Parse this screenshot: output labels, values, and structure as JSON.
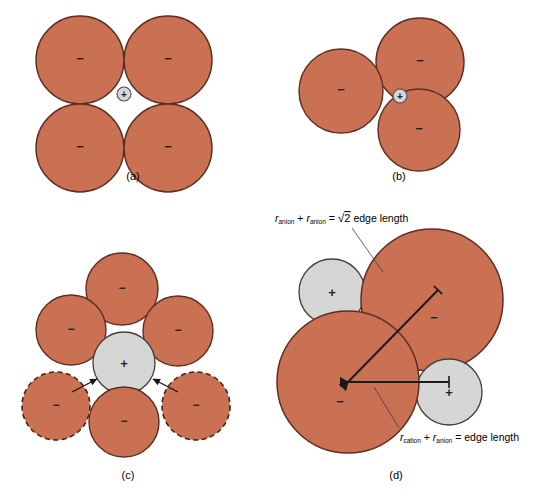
{
  "figure": {
    "background_color": "#ffffff",
    "colors": {
      "anion_fill": "#ca7053",
      "anion_stroke": "#5d2f22",
      "cation_fill": "#d6d6d4",
      "cation_stroke": "#4c4c4c",
      "line_color": "#1a1a1a",
      "text_color": "#000000"
    },
    "panels": [
      {
        "id": "a",
        "caption": "(a)",
        "caption_x": 133,
        "caption_y": 180,
        "description": "Four equal anions in square arrangement with a very small cation in the central hole",
        "circles": [
          {
            "name": "anion-top-left",
            "cx": 80,
            "cy": 60,
            "r": 44,
            "type": "anion",
            "sign": "−",
            "outline": "solid"
          },
          {
            "name": "anion-top-right",
            "cx": 168,
            "cy": 60,
            "r": 44,
            "type": "anion",
            "sign": "−",
            "outline": "solid"
          },
          {
            "name": "anion-bottom-left",
            "cx": 80,
            "cy": 148,
            "r": 44,
            "type": "anion",
            "sign": "−",
            "outline": "solid"
          },
          {
            "name": "anion-bottom-right",
            "cx": 168,
            "cy": 148,
            "r": 44,
            "type": "anion",
            "sign": "−",
            "outline": "solid"
          },
          {
            "name": "cation-center",
            "cx": 124,
            "cy": 94,
            "r": 7,
            "type": "cation",
            "sign": "+",
            "outline": "solid"
          }
        ]
      },
      {
        "id": "b",
        "caption": "(b)",
        "caption_x": 399,
        "caption_y": 180,
        "description": "Three equal anions in triangular arrangement with a very small cation in the central hole",
        "circles": [
          {
            "name": "anion-upper-right",
            "cx": 420,
            "cy": 62,
            "r": 44,
            "type": "anion",
            "sign": "−",
            "outline": "solid"
          },
          {
            "name": "anion-left",
            "cx": 341,
            "cy": 91,
            "r": 42,
            "type": "anion",
            "sign": "−",
            "outline": "solid"
          },
          {
            "name": "anion-lower-right",
            "cx": 419,
            "cy": 130,
            "r": 41,
            "type": "anion",
            "sign": "−",
            "outline": "solid"
          },
          {
            "name": "cation-center",
            "cx": 400,
            "cy": 96,
            "r": 7,
            "type": "cation",
            "sign": "+",
            "outline": "solid"
          }
        ]
      },
      {
        "id": "c",
        "caption": "(c)",
        "caption_x": 128,
        "caption_y": 479,
        "description": "A central cation surrounded by four anions, with two additional dashed anions being pushed in from the sides",
        "circles": [
          {
            "name": "anion-top",
            "cx": 122,
            "cy": 289,
            "r": 36,
            "type": "anion",
            "sign": "−",
            "outline": "solid"
          },
          {
            "name": "anion-upper-left",
            "cx": 71,
            "cy": 330,
            "r": 35,
            "type": "anion",
            "sign": "−",
            "outline": "solid"
          },
          {
            "name": "anion-upper-right",
            "cx": 178,
            "cy": 331,
            "r": 35,
            "type": "anion",
            "sign": "−",
            "outline": "solid"
          },
          {
            "name": "anion-bottom",
            "cx": 124,
            "cy": 422,
            "r": 35,
            "type": "anion",
            "sign": "−",
            "outline": "solid"
          },
          {
            "name": "anion-dashed-left",
            "cx": 56,
            "cy": 406,
            "r": 34,
            "type": "anion",
            "sign": "−",
            "outline": "dashed"
          },
          {
            "name": "anion-dashed-right",
            "cx": 196,
            "cy": 406,
            "r": 34,
            "type": "anion",
            "sign": "−",
            "outline": "dashed"
          },
          {
            "name": "cation-center",
            "cx": 124,
            "cy": 363,
            "r": 31,
            "type": "cation",
            "sign": "+",
            "outline": "solid"
          }
        ],
        "arrows": [
          {
            "name": "arrow-left-inward",
            "x1": 72,
            "y1": 392,
            "x2": 97,
            "y2": 379
          },
          {
            "name": "arrow-right-inward",
            "x1": 178,
            "y1": 392,
            "x2": 153,
            "y2": 379
          }
        ]
      },
      {
        "id": "d",
        "caption": "(d)",
        "caption_x": 396,
        "caption_y": 479,
        "description": "Face of a unit cell: two large anions and two smaller cations, annotated with edge-length relationships",
        "circles": [
          {
            "name": "anion-upper-right",
            "cx": 432,
            "cy": 300,
            "r": 71,
            "type": "anion",
            "sign": "−",
            "sign_dx": 2,
            "sign_dy": 18,
            "outline": "solid"
          },
          {
            "name": "anion-lower-left",
            "cx": 348,
            "cy": 382,
            "r": 71,
            "type": "anion",
            "sign": "−",
            "sign_dx": -8,
            "sign_dy": 24,
            "outline": "solid"
          },
          {
            "name": "cation-upper-left",
            "cx": 332,
            "cy": 292,
            "r": 33,
            "type": "cation",
            "sign": "+",
            "outline": "solid"
          },
          {
            "name": "cation-lower-right",
            "cx": 449,
            "cy": 392,
            "r": 33,
            "type": "cation",
            "sign": "+",
            "outline": "solid"
          }
        ],
        "arrows": [
          {
            "name": "arrow-diagonal-anion-anion",
            "x1": 348,
            "y1": 382,
            "x2": 438,
            "y2": 290,
            "barbed": true
          },
          {
            "name": "arrow-horizontal-cation-anion",
            "x1": 348,
            "y1": 382,
            "x2": 449,
            "y2": 382,
            "barbed": true
          }
        ],
        "leaders": [
          {
            "name": "leader-anion-anion",
            "x1": 352,
            "y1": 228,
            "x2": 383,
            "y2": 272
          },
          {
            "name": "leader-cation-anion",
            "x1": 399,
            "y1": 428,
            "x2": 374,
            "y2": 387
          }
        ],
        "labels": [
          {
            "name": "anion-anion-equation",
            "x": 275,
            "y": 222,
            "anchor": "start",
            "parts": [
              {
                "text": "r",
                "style": "italic"
              },
              {
                "text": "anion",
                "style": "sub"
              },
              {
                "text": " + ",
                "style": "normal"
              },
              {
                "text": "r",
                "style": "italic"
              },
              {
                "text": "anion",
                "style": "sub"
              },
              {
                "text": " = ",
                "style": "normal"
              },
              {
                "text": "√2 edge length",
                "style": "normal"
              }
            ],
            "plain": "r anion + r anion = √2 edge length"
          },
          {
            "name": "cation-anion-equation",
            "x": 400,
            "y": 441,
            "anchor": "start",
            "parts": [
              {
                "text": "r",
                "style": "italic"
              },
              {
                "text": "cation",
                "style": "sub"
              },
              {
                "text": " + ",
                "style": "normal"
              },
              {
                "text": "r",
                "style": "italic"
              },
              {
                "text": "anion",
                "style": "sub"
              },
              {
                "text": " = ",
                "style": "normal"
              },
              {
                "text": "edge length",
                "style": "normal"
              }
            ],
            "plain": "r cation + r anion = edge length"
          }
        ]
      }
    ]
  }
}
